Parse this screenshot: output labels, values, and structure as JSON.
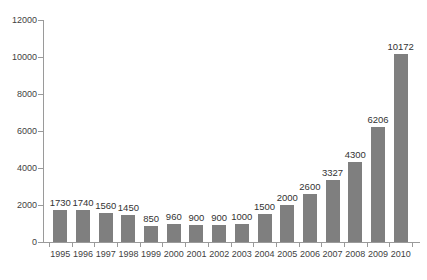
{
  "chart_data": {
    "type": "bar",
    "title": "",
    "subtitle": "",
    "xlabel": "",
    "ylabel": "",
    "categories": [
      "1995",
      "1996",
      "1997",
      "1998",
      "1999",
      "2000",
      "2001",
      "2002",
      "2003",
      "2004",
      "2005",
      "2006",
      "2007",
      "2008",
      "2009",
      "2010"
    ],
    "values": [
      1730,
      1740,
      1560,
      1450,
      850,
      960,
      900,
      900,
      1000,
      1500,
      2000,
      2600,
      3327,
      4300,
      6206,
      10172
    ],
    "data_labels": [
      "1730",
      "1740",
      "1560",
      "1450",
      "850",
      "960",
      "900",
      "900",
      "1000",
      "1500",
      "2000",
      "2600",
      "3327",
      "4300",
      "6206",
      "10172"
    ],
    "ylim": [
      0,
      12000
    ],
    "ytick_values": [
      0,
      2000,
      4000,
      6000,
      8000,
      10000,
      12000
    ],
    "ytick_labels": [
      "0",
      "2000",
      "4000",
      "6000",
      "8000",
      "10000",
      "12000"
    ],
    "grid": false,
    "legend": null,
    "legend_position": "none",
    "bar_color": "#7f7f7f",
    "axis_color": "#9a9a9a",
    "text_color": "#3f3f3f",
    "background": "#ffffff"
  },
  "caption": {
    "text": "",
    "clipped": true
  }
}
